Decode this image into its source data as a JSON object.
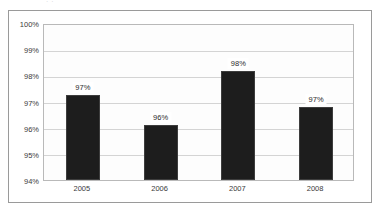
{
  "top_clipped_text": ". .",
  "colors": {
    "bar_fill": "#1d1d1d",
    "bar_stroke": "#3d3d3d",
    "gridline": "#d4d4d4",
    "frame_border": "#9a9a9a",
    "plot_border": "#b9b9b9",
    "plot_background": "#fdfdfd",
    "page_background": "#ffffff",
    "text": "#3a3a3a"
  },
  "chart_data": {
    "type": "bar",
    "title": "",
    "xlabel": "",
    "ylabel": "",
    "categories": [
      "2005",
      "2006",
      "2007",
      "2008"
    ],
    "values": [
      97.25,
      96.1,
      98.15,
      96.8
    ],
    "data_labels": [
      "97%",
      "96%",
      "98%",
      "97%"
    ],
    "ylim": [
      94,
      100
    ],
    "ytick_values": [
      94,
      95,
      96,
      97,
      98,
      99,
      100
    ],
    "ytick_labels": [
      "94%",
      "95%",
      "96%",
      "97%",
      "98%",
      "99%",
      "100%"
    ],
    "grid": true,
    "legend": false,
    "series": [
      {
        "name": "",
        "values": [
          97.25,
          96.1,
          98.15,
          96.8
        ]
      }
    ]
  }
}
